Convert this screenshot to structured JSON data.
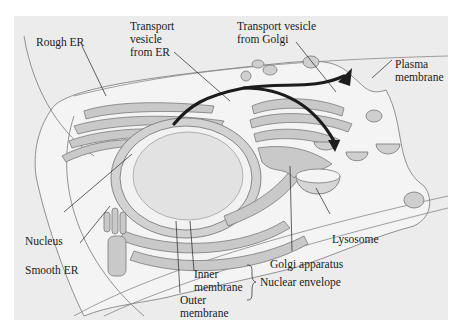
{
  "figure": {
    "type": "cell-diagram",
    "colors": {
      "background": "#ececec",
      "cytoplasm": "#f4f4f4",
      "organelle_fill": "#c9c9c9",
      "organelle_stroke": "#7a7a7a",
      "nucleus_fill": "#e2e2e2",
      "pathway_arrow": "#1c1c1c",
      "leader_line": "#222222"
    },
    "labels": {
      "rough_er": "Rough ER",
      "transport_vesicle_er_1": "Transport",
      "transport_vesicle_er_2": "vesicle",
      "transport_vesicle_er_3": "from ER",
      "transport_vesicle_golgi_1": "Transport vesicle",
      "transport_vesicle_golgi_2": "from Golgi",
      "plasma_membrane_1": "Plasma",
      "plasma_membrane_2": "membrane",
      "nucleus": "Nucleus",
      "smooth_er": "Smooth ER",
      "lysosome": "Lysosome",
      "golgi_apparatus": "Golgi apparatus",
      "inner_membrane_1": "Inner",
      "inner_membrane_2": "membrane",
      "outer_membrane_1": "Outer",
      "outer_membrane_2": "membrane",
      "nuclear_envelope": "Nuclear envelope"
    }
  }
}
